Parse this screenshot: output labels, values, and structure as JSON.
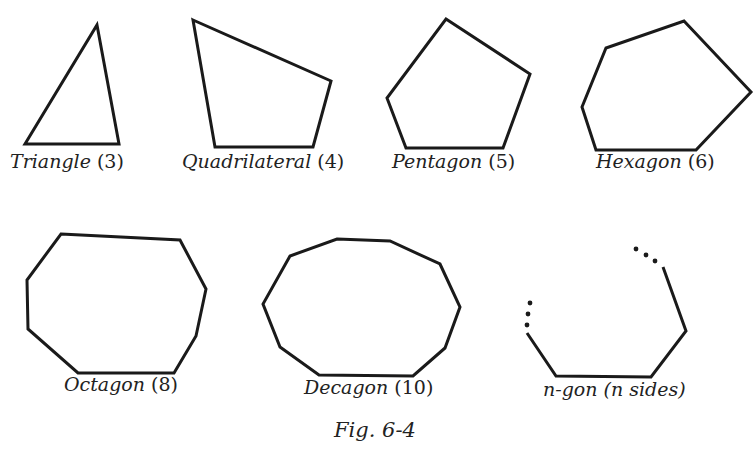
{
  "figure": {
    "caption": "Fig. 6-4",
    "stroke_color": "#1a1a1a",
    "text_color": "#222222",
    "background": "#ffffff"
  },
  "polygons": [
    {
      "id": "triangle",
      "name": "Triangle",
      "count": "(3)",
      "sides": 3,
      "points": "97,25 119,144 25,144"
    },
    {
      "id": "quadrilateral",
      "name": "Quadrilateral",
      "count": "(4)",
      "sides": 4,
      "points": "193,20 331,81 313,147 215,147"
    },
    {
      "id": "pentagon",
      "name": "Pentagon",
      "count": "(5)",
      "sides": 5,
      "points": "446,19 530,74 503,148 406,148 387,98"
    },
    {
      "id": "hexagon",
      "name": "Hexagon",
      "count": "(6)",
      "sides": 6,
      "points": "684,21 751,92 696,150 596,150 582,107 606,48"
    },
    {
      "id": "octagon",
      "name": "Octagon",
      "count": "(8)",
      "sides": 8,
      "points": "61,234 180,240 206,289 196,336 174,373 78,373 28,329 27,280"
    },
    {
      "id": "decagon",
      "name": "Decagon",
      "count": "(10)",
      "sides": 10,
      "points": "337,239 390,241 440,264 460,307 445,348 413,376 319,375 280,347 263,304 290,256"
    },
    {
      "id": "n-gon",
      "name": "n-gon",
      "count": "(n sides)",
      "sides": "n",
      "points": "527,333 556,376 651,377 686,331 663,267"
    }
  ]
}
